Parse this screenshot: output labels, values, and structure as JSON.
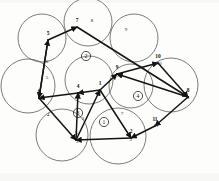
{
  "figure": {
    "type": "geometric-diagram",
    "canvas": {
      "width": 219,
      "height": 181
    },
    "background_color": "#fdfdfc",
    "circle_stroke_color": "#5a5a58",
    "edge_color": "#141414",
    "label_color": "#111111"
  },
  "coverage_circles": [
    {
      "name": "circle-top",
      "cx": 88,
      "cy": 22,
      "r": 24
    },
    {
      "name": "circle-upper-left",
      "cx": 42,
      "cy": 38,
      "r": 24
    },
    {
      "name": "circle-upper-right",
      "cx": 134,
      "cy": 38,
      "r": 24
    },
    {
      "name": "circle-left",
      "cx": 28,
      "cy": 86,
      "r": 27
    },
    {
      "name": "circle-center",
      "cx": 89,
      "cy": 80,
      "r": 24
    },
    {
      "name": "circle-right",
      "cx": 171,
      "cy": 85,
      "r": 27
    },
    {
      "name": "circle-mid-right",
      "cx": 131,
      "cy": 86,
      "r": 22
    },
    {
      "name": "circle-lower-left",
      "cx": 62,
      "cy": 135,
      "r": 26
    },
    {
      "name": "circle-lower-right",
      "cx": 118,
      "cy": 136,
      "r": 28
    }
  ],
  "nodes": [
    {
      "id": "n1",
      "label": "1",
      "x": 100,
      "y": 90
    },
    {
      "id": "n2",
      "label": "2",
      "x": 131,
      "y": 138
    },
    {
      "id": "n3",
      "label": "3",
      "x": 76,
      "y": 140
    },
    {
      "id": "n4",
      "label": "4",
      "x": 78,
      "y": 93
    },
    {
      "id": "n5",
      "label": "5",
      "x": 48,
      "y": 40
    },
    {
      "id": "n6",
      "label": "6",
      "x": 39,
      "y": 98
    },
    {
      "id": "n7",
      "label": "7",
      "x": 77,
      "y": 27
    },
    {
      "id": "n8",
      "label": "8",
      "x": 188,
      "y": 97
    },
    {
      "id": "n9",
      "label": "9",
      "x": 117,
      "y": 74
    },
    {
      "id": "n10",
      "label": "10",
      "x": 158,
      "y": 63
    },
    {
      "id": "n11",
      "label": "11",
      "x": 155,
      "y": 126
    }
  ],
  "edges": [
    {
      "name": "edge-6-5",
      "from": "6",
      "to": "5",
      "label": "6",
      "label_x": 47,
      "label_y": 62
    },
    {
      "name": "edge-5-7",
      "from": "5",
      "to": "7",
      "label": "7",
      "label_x": 73,
      "label_y": 28
    },
    {
      "name": "edge-7-8",
      "from": "7",
      "to": "8",
      "label": "8",
      "label_x": 92,
      "label_y": 21
    },
    {
      "name": "edge-8-9",
      "from": "8",
      "to": "9",
      "label": "9",
      "label_x": 126,
      "label_y": 30
    },
    {
      "name": "edge-9-10",
      "from": "9",
      "to": "10",
      "label": "10",
      "label_x": 159,
      "label_y": 64
    },
    {
      "name": "edge-10-8",
      "from": "10",
      "to": "8",
      "label": "8",
      "label_x": 188,
      "label_y": 98
    },
    {
      "name": "edge-8-11",
      "from": "8",
      "to": "11",
      "label": "11",
      "label_x": 156,
      "label_y": 126
    },
    {
      "name": "edge-11-2",
      "from": "11",
      "to": "2",
      "label": "2",
      "label_x": 131,
      "label_y": 140
    },
    {
      "name": "edge-2-3",
      "from": "2",
      "to": "3",
      "label": "3",
      "label_x": 77,
      "label_y": 142
    },
    {
      "name": "edge-3-1",
      "from": "3",
      "to": "1",
      "label": "1",
      "label_x": 101,
      "label_y": 92
    },
    {
      "name": "edge-1-4",
      "from": "1",
      "to": "4",
      "label": "4",
      "label_x": 79,
      "label_y": 95
    },
    {
      "name": "edge-4-6",
      "from": "4",
      "to": "6",
      "label": "6",
      "label_x": 40,
      "label_y": 99
    },
    {
      "name": "edge-6-3",
      "from": "6",
      "to": "3",
      "label": "4",
      "label_x": 48,
      "label_y": 115
    },
    {
      "name": "edge-1-9",
      "from": "1",
      "to": "9",
      "label": "9",
      "label_x": 118,
      "label_y": 76
    },
    {
      "name": "edge-1-2",
      "from": "1",
      "to": "2",
      "label": "7",
      "label_x": 122,
      "label_y": 114
    },
    {
      "name": "edge-3-4",
      "from": "3",
      "to": "4",
      "label": "3",
      "label_x": 83,
      "label_y": 119
    },
    {
      "name": "edge-5-6b",
      "from": "5",
      "to": "6",
      "label": "5",
      "label_x": 47,
      "label_y": 78
    }
  ],
  "face_labels": [
    {
      "name": "face-1",
      "label": "1",
      "x": 104,
      "y": 122
    },
    {
      "name": "face-2",
      "label": "2",
      "x": 86,
      "y": 56
    },
    {
      "name": "face-3",
      "label": "3",
      "x": 78,
      "y": 113
    },
    {
      "name": "face-4",
      "label": "4",
      "x": 138,
      "y": 96
    }
  ]
}
